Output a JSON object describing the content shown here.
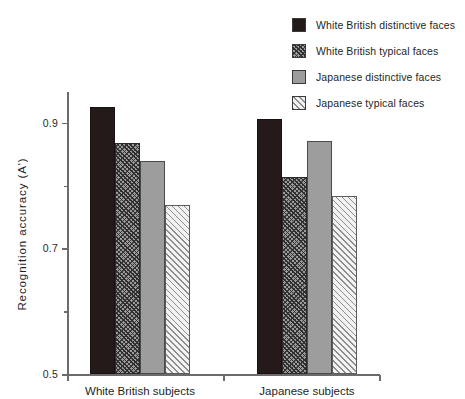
{
  "chart_data": {
    "type": "bar",
    "title": "",
    "xlabel": "",
    "ylabel": "Recognition  accuracy  (A')",
    "ylim": [
      0.5,
      0.95
    ],
    "grid": false,
    "legend_position": "top-right",
    "categories": [
      "White British subjects",
      "Japanese subjects"
    ],
    "y_ticks": [
      {
        "value": 0.9,
        "label": "0.9",
        "minor": false
      },
      {
        "value": 0.8,
        "label": "",
        "minor": true
      },
      {
        "value": 0.7,
        "label": "0.7",
        "minor": false
      },
      {
        "value": 0.6,
        "label": "",
        "minor": true
      },
      {
        "value": 0.5,
        "label": "0.5",
        "minor": false
      }
    ],
    "series": [
      {
        "name": "White British distinctive faces",
        "fill": "solid-dark",
        "color": "#241a19",
        "values": [
          0.925,
          0.906
        ]
      },
      {
        "name": "White British typical faces",
        "fill": "hatch-dark",
        "color": "#2e2e2e",
        "values": [
          0.867,
          0.813
        ]
      },
      {
        "name": "Japanese distinctive faces",
        "fill": "solid-gray",
        "color": "#9d9d9d",
        "values": [
          0.838,
          0.871
        ]
      },
      {
        "name": "Japanese typical faces",
        "fill": "hatch-light",
        "color": "#8c8c8c",
        "values": [
          0.769,
          0.783
        ]
      }
    ]
  },
  "legend": {
    "items": [
      {
        "label": "White British distinctive faces",
        "fill": "solid-dark"
      },
      {
        "label": "White British typical faces",
        "fill": "hatch-dark"
      },
      {
        "label": "Japanese distinctive faces",
        "fill": "solid-gray"
      },
      {
        "label": "Japanese typical faces",
        "fill": "hatch-light"
      }
    ]
  }
}
